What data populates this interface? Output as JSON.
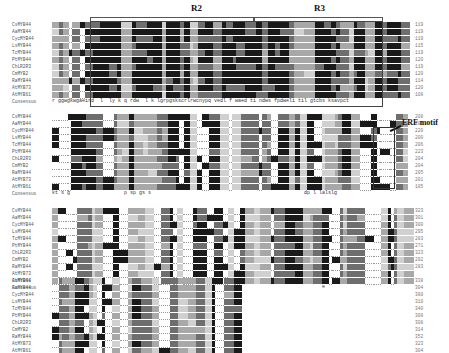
{
  "figure": {
    "type": "multiple-sequence-alignment",
    "region_labels": [
      "R2",
      "R3"
    ],
    "motif_label": "ERF motif"
  },
  "sequences": [
    "CsMYB44",
    "AaMYB44",
    "CycMYB44",
    "LsMYB44",
    "TcMYB44",
    "PtMYB44",
    "ChLR2R3",
    "CmMYB2",
    "RaMYB44",
    "AtMYB73",
    "AtMYB61"
  ],
  "consensus_label": "Consensus",
  "blocks": [
    {
      "end_positions": [
        "119",
        "119",
        "119",
        "115",
        "119",
        "120",
        "119",
        "120",
        "114",
        "120",
        "108"
      ],
      "consensus": "r ggwgkwgaeird  l  ly k q rdw  l k lgrpgskscrlrwcnypq vedl f waed ti ndws fpdweli til gtcbs ksavpct"
    },
    {
      "end_positions": [
        "208",
        "205",
        "220",
        "200",
        "206",
        "223",
        "204",
        "204",
        "205",
        "201",
        "185"
      ],
      "consensus": "kt s g                  p sp gs s                                                   dp l lalslg"
    },
    {
      "end_positions": [
        "323",
        "301",
        "300",
        "295",
        "283",
        "271",
        "323",
        "292",
        "283",
        "",
        ""
      ],
      "consensus": "                                                                                          e"
    },
    {
      "end_positions": [
        "338",
        "304",
        "380",
        "310",
        "340",
        "308",
        "308",
        "314",
        "352",
        "323",
        "304"
      ],
      "consensus": "q el   evr  ym                       g"
    }
  ],
  "colors": {
    "identical": "#1a1a1a",
    "high": "#6e6e6e",
    "medium": "#a8a8a8",
    "low": "#d0d0d0",
    "text": "#555555"
  }
}
